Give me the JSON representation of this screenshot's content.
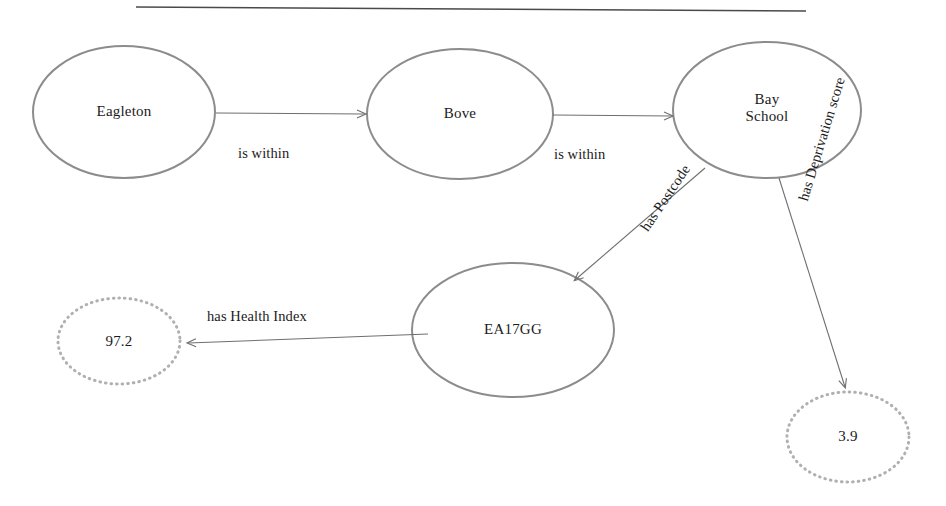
{
  "diagram": {
    "title_rule": "horizontal-rule",
    "background_color": "#ffffff",
    "solid_node_stroke": "#8c8c8c",
    "dotted_node_stroke": "#b0b0b0",
    "edge_color": "#6f6f6f",
    "text_color": "#1b1b1b",
    "nodes": [
      {
        "id": "eagleton",
        "label": "Eagleton",
        "style": "solid-ellipse",
        "cx": 124,
        "cy": 112,
        "rx": 91,
        "ry": 66
      },
      {
        "id": "bove",
        "label": "Bove",
        "style": "solid-ellipse",
        "cx": 460,
        "cy": 114,
        "rx": 93,
        "ry": 65
      },
      {
        "id": "bay-school",
        "label": "Bay\nSchool",
        "style": "solid-ellipse",
        "cx": 767,
        "cy": 110,
        "rx": 94,
        "ry": 68
      },
      {
        "id": "ea17gg",
        "label": "EA17GG",
        "style": "solid-ellipse",
        "cx": 513,
        "cy": 330,
        "rx": 101,
        "ry": 67
      },
      {
        "id": "health-index-value",
        "label": "97.2",
        "style": "dotted-ellipse",
        "cx": 119,
        "cy": 341,
        "rx": 61,
        "ry": 43
      },
      {
        "id": "deprivation-score-value",
        "label": "3.9",
        "style": "dotted-ellipse",
        "cx": 848,
        "cy": 437,
        "rx": 61,
        "ry": 45
      }
    ],
    "edges": [
      {
        "id": "eagleton-is-within-bove",
        "label": "is within",
        "from": "eagleton",
        "to": "bove",
        "label_x": 238,
        "label_y": 145,
        "rotation": 0
      },
      {
        "id": "bove-is-within-bay-school",
        "label": "is within",
        "from": "bove",
        "to": "bay-school",
        "label_x": 554,
        "label_y": 146,
        "rotation": 0
      },
      {
        "id": "bay-school-has-postcode-ea17gg",
        "label": "has Postcode",
        "from": "bay-school",
        "to": "ea17gg",
        "label_x": 637,
        "label_y": 225,
        "rotation": -56
      },
      {
        "id": "bay-school-has-deprivation-score",
        "label": "has Deprivation score",
        "from": "bay-school",
        "to": "deprivation-score-value",
        "label_x": 795,
        "label_y": 198,
        "rotation": -73
      },
      {
        "id": "ea17gg-has-health-index",
        "label": "has Health Index",
        "from": "ea17gg",
        "to": "health-index-value",
        "label_x": 207,
        "label_y": 308,
        "rotation": 0
      }
    ]
  }
}
